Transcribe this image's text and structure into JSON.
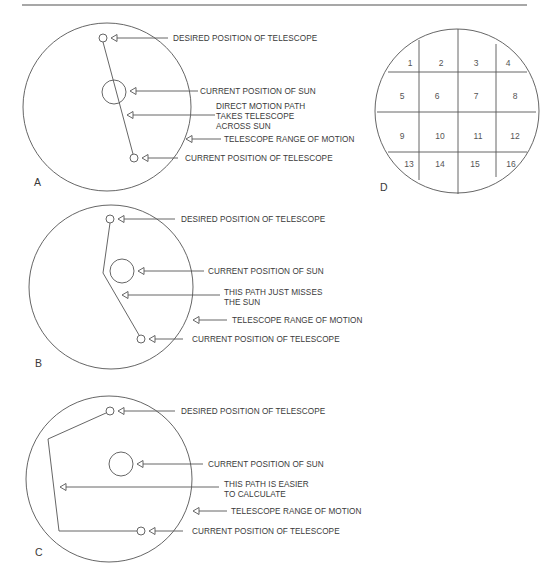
{
  "figure": {
    "top_rule": {
      "x1": 22,
      "x2": 527,
      "y": 5
    },
    "colors": {
      "line": "#555555",
      "text": "#3a3a3a",
      "rule": "#8a8a8a",
      "background": "#ffffff"
    }
  },
  "panels": [
    {
      "id": "A",
      "letter": "A",
      "letter_pos": [
        34,
        186
      ],
      "range_circle": {
        "cx": 107,
        "cy": 107,
        "r": 84
      },
      "sun": {
        "cx": 114,
        "cy": 92,
        "r": 12
      },
      "desired": {
        "cx": 103,
        "cy": 38,
        "r": 4
      },
      "current": {
        "cx": 134,
        "cy": 158,
        "r": 4
      },
      "path": [
        [
          103,
          42
        ],
        [
          133,
          154
        ]
      ],
      "callouts": [
        {
          "key": "desired",
          "tip": [
            111,
            38
          ],
          "line_end": 168,
          "text_x": 173,
          "text_y": 41,
          "lines": [
            "DESIRED POSITION OF TELESCOPE"
          ]
        },
        {
          "key": "sun",
          "tip": [
            130,
            91
          ],
          "line_end": 198,
          "text_x": 200,
          "text_y": 94,
          "lines": [
            "CURRENT POSITION OF SUN"
          ]
        },
        {
          "key": "path",
          "tip": [
            127,
            115
          ],
          "line_end": 215,
          "text_x": 216,
          "text_y": 109,
          "lines": [
            "DIRECT MOTION PATH",
            "TAKES TELESCOPE",
            "ACROSS SUN"
          ]
        },
        {
          "key": "range",
          "tip": [
            186,
            139
          ],
          "line_end": 221,
          "text_x": 224,
          "text_y": 142,
          "lines": [
            "TELESCOPE RANGE OF MOTION"
          ]
        },
        {
          "key": "current",
          "tip": [
            142,
            158
          ],
          "line_end": 178,
          "text_x": 185,
          "text_y": 161,
          "lines": [
            "CURRENT POSITION OF TELESCOPE"
          ]
        }
      ]
    },
    {
      "id": "B",
      "letter": "B",
      "letter_pos": [
        35,
        367
      ],
      "range_circle": {
        "cx": 111,
        "cy": 287,
        "r": 82
      },
      "sun": {
        "cx": 122,
        "cy": 271,
        "r": 12
      },
      "desired": {
        "cx": 110,
        "cy": 219,
        "r": 4
      },
      "current": {
        "cx": 141,
        "cy": 339,
        "r": 4
      },
      "path": [
        [
          110,
          223
        ],
        [
          103,
          273
        ],
        [
          139,
          335
        ]
      ],
      "callouts": [
        {
          "key": "desired",
          "tip": [
            118,
            219
          ],
          "line_end": 175,
          "text_x": 181,
          "text_y": 222,
          "lines": [
            "DESIRED POSITION OF TELESCOPE"
          ]
        },
        {
          "key": "sun",
          "tip": [
            138,
            271
          ],
          "line_end": 204,
          "text_x": 208,
          "text_y": 274,
          "lines": [
            "CURRENT POSITION OF SUN"
          ]
        },
        {
          "key": "path",
          "tip": [
            122,
            295
          ],
          "line_end": 220,
          "text_x": 224,
          "text_y": 295,
          "lines": [
            "THIS PATH JUST MISSES",
            "THE SUN"
          ]
        },
        {
          "key": "range",
          "tip": [
            193,
            320
          ],
          "line_end": 227,
          "text_x": 232,
          "text_y": 323,
          "lines": [
            "TELESCOPE RANGE OF MOTION"
          ]
        },
        {
          "key": "current",
          "tip": [
            149,
            339
          ],
          "line_end": 183,
          "text_x": 192,
          "text_y": 342,
          "lines": [
            "CURRENT POSITION OF TELESCOPE"
          ]
        }
      ]
    },
    {
      "id": "C",
      "letter": "C",
      "letter_pos": [
        35,
        556
      ],
      "range_circle": {
        "cx": 109,
        "cy": 479,
        "r": 83
      },
      "sun": {
        "cx": 121,
        "cy": 464,
        "r": 12
      },
      "desired": {
        "cx": 110,
        "cy": 411,
        "r": 4
      },
      "current": {
        "cx": 141,
        "cy": 531,
        "r": 4
      },
      "path": [
        [
          106,
          413
        ],
        [
          48,
          439
        ],
        [
          59,
          531
        ],
        [
          137,
          531
        ]
      ],
      "callouts": [
        {
          "key": "desired",
          "tip": [
            118,
            411
          ],
          "line_end": 175,
          "text_x": 181,
          "text_y": 414,
          "lines": [
            "DESIRED POSITION OF TELESCOPE"
          ]
        },
        {
          "key": "sun",
          "tip": [
            137,
            464
          ],
          "line_end": 203,
          "text_x": 208,
          "text_y": 467,
          "lines": [
            "CURRENT POSITION OF SUN"
          ]
        },
        {
          "key": "path",
          "tip": [
            60,
            487
          ],
          "line_end": 219,
          "text_x": 224,
          "text_y": 487,
          "lines": [
            "THIS PATH  IS EASIER",
            "TO CALCULATE"
          ]
        },
        {
          "key": "range",
          "tip": [
            193,
            511
          ],
          "line_end": 227,
          "text_x": 231,
          "text_y": 514,
          "lines": [
            "TELESCOPE RANGE OF MOTION"
          ]
        },
        {
          "key": "current",
          "tip": [
            149,
            531
          ],
          "line_end": 183,
          "text_x": 192,
          "text_y": 534,
          "lines": [
            "CURRENT POSITION OF TELESCOPE"
          ]
        }
      ]
    }
  ],
  "grid_panel": {
    "id": "D",
    "letter": "D",
    "letter_pos": [
      380,
      191
    ],
    "circle": {
      "cx": 457,
      "cy": 111,
      "r": 82
    },
    "vertical_lines": [
      {
        "x": 419,
        "y1": 40,
        "y2": 180
      },
      {
        "x": 458,
        "y1": 29,
        "y2": 194
      },
      {
        "x": 496,
        "y1": 44,
        "y2": 177
      }
    ],
    "horizontal_lines": [
      {
        "y": 72,
        "x1": 388,
        "x2": 527
      },
      {
        "y": 112,
        "x1": 377,
        "x2": 536
      },
      {
        "y": 152,
        "x1": 388,
        "x2": 527
      }
    ],
    "cells": [
      {
        "n": "1",
        "x": 410,
        "y": 66
      },
      {
        "n": "2",
        "x": 441,
        "y": 66
      },
      {
        "n": "3",
        "x": 476,
        "y": 66
      },
      {
        "n": "4",
        "x": 508,
        "y": 66
      },
      {
        "n": "5",
        "x": 402,
        "y": 99
      },
      {
        "n": "6",
        "x": 437,
        "y": 99
      },
      {
        "n": "7",
        "x": 476,
        "y": 99
      },
      {
        "n": "8",
        "x": 515,
        "y": 99
      },
      {
        "n": "9",
        "x": 402,
        "y": 139
      },
      {
        "n": "10",
        "x": 440,
        "y": 139
      },
      {
        "n": "11",
        "x": 478,
        "y": 139
      },
      {
        "n": "12",
        "x": 515,
        "y": 139
      },
      {
        "n": "13",
        "x": 409,
        "y": 167
      },
      {
        "n": "14",
        "x": 440,
        "y": 167
      },
      {
        "n": "15",
        "x": 475,
        "y": 167
      },
      {
        "n": "16",
        "x": 511,
        "y": 167
      }
    ]
  }
}
